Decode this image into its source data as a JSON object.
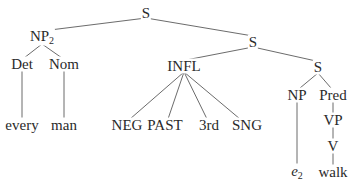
{
  "diagram": {
    "type": "syntax-tree",
    "nodes": [
      {
        "id": "s_root",
        "label": "S",
        "x": 146,
        "y": 13
      },
      {
        "id": "np2",
        "label": "NP",
        "sub": "2",
        "x": 42,
        "y": 38
      },
      {
        "id": "s_mid",
        "label": "S",
        "x": 253,
        "y": 42
      },
      {
        "id": "det",
        "label": "Det",
        "x": 22,
        "y": 64
      },
      {
        "id": "nom",
        "label": "Nom",
        "x": 64,
        "y": 64
      },
      {
        "id": "infl",
        "label": "INFL",
        "x": 184,
        "y": 66
      },
      {
        "id": "s_inner",
        "label": "S",
        "x": 318,
        "y": 67
      },
      {
        "id": "every",
        "label": "every",
        "x": 22,
        "y": 125
      },
      {
        "id": "man",
        "label": "man",
        "x": 64,
        "y": 125
      },
      {
        "id": "neg",
        "label": "NEG",
        "x": 127,
        "y": 125
      },
      {
        "id": "past",
        "label": "PAST",
        "x": 165,
        "y": 125
      },
      {
        "id": "third",
        "label": "3rd",
        "x": 209,
        "y": 125
      },
      {
        "id": "sng",
        "label": "SNG",
        "x": 247,
        "y": 125
      },
      {
        "id": "np",
        "label": "NP",
        "x": 297,
        "y": 95
      },
      {
        "id": "pred",
        "label": "Pred",
        "x": 333,
        "y": 95
      },
      {
        "id": "vp",
        "label": "VP",
        "x": 333,
        "y": 120
      },
      {
        "id": "v",
        "label": "V",
        "x": 333,
        "y": 146
      },
      {
        "id": "e2",
        "label": "e",
        "sub": "2",
        "italic": true,
        "x": 297,
        "y": 172
      },
      {
        "id": "walk",
        "label": "walk",
        "x": 333,
        "y": 172
      }
    ],
    "edges": [
      [
        "s_root",
        "np2"
      ],
      [
        "s_root",
        "s_mid"
      ],
      [
        "np2",
        "det"
      ],
      [
        "np2",
        "nom"
      ],
      [
        "det",
        "every"
      ],
      [
        "nom",
        "man"
      ],
      [
        "s_mid",
        "infl"
      ],
      [
        "s_mid",
        "s_inner"
      ],
      [
        "infl",
        "neg"
      ],
      [
        "infl",
        "past"
      ],
      [
        "infl",
        "third"
      ],
      [
        "infl",
        "sng"
      ],
      [
        "s_inner",
        "np"
      ],
      [
        "s_inner",
        "pred"
      ],
      [
        "np",
        "e2"
      ],
      [
        "pred",
        "vp"
      ],
      [
        "vp",
        "v"
      ],
      [
        "v",
        "walk"
      ]
    ]
  }
}
